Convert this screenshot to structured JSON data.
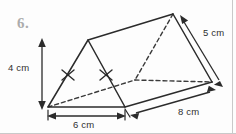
{
  "figure": {
    "question_number": "6.",
    "shape_name": "triangular-prism",
    "stroke_color": "#2b2b2b",
    "background_color": "#fdfdfd",
    "labels": {
      "height": "4 cm",
      "base": "6 cm",
      "length": "8 cm",
      "slant": "5 cm"
    },
    "measurements": [
      {
        "name": "height",
        "value": 4,
        "unit": "cm",
        "text": "4 cm",
        "orientation": "vertical",
        "position": "left"
      },
      {
        "name": "base",
        "value": 6,
        "unit": "cm",
        "text": "6 cm",
        "orientation": "horizontal",
        "position": "bottom"
      },
      {
        "name": "length",
        "value": 8,
        "unit": "cm",
        "text": "8 cm",
        "orientation": "diagonal",
        "position": "bottom-right"
      },
      {
        "name": "slant",
        "value": 5,
        "unit": "cm",
        "text": "5 cm",
        "orientation": "diagonal",
        "position": "top-right"
      }
    ],
    "tick_marks": {
      "count": 2,
      "meaning": "congruent-sides"
    },
    "vertices": {
      "front_apex": [
        88,
        40
      ],
      "front_bottom_left": [
        48,
        107
      ],
      "front_bottom_right": [
        125,
        107
      ],
      "back_apex": [
        173,
        14
      ],
      "back_bottom_right": [
        212,
        82
      ],
      "back_bottom_left": [
        135,
        80
      ]
    }
  }
}
